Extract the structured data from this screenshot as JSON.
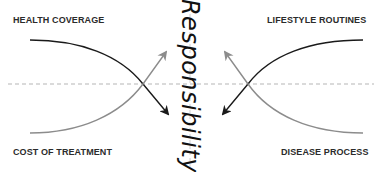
{
  "diagram": {
    "center_label": "Responsibility",
    "corners": {
      "top_left": "HEALTH COVERAGE",
      "top_right": "LIFESTYLE ROUTINES",
      "bottom_left": "COST OF TREATMENT",
      "bottom_right": "DISEASE PROCESS"
    },
    "colors": {
      "dark_arrow": "#1a1a1a",
      "light_arrow": "#8c8c8c",
      "dashed_line": "#b5b5b5",
      "text": "#2b2b2b"
    },
    "arrows": [
      {
        "from": "HEALTH COVERAGE",
        "direction": "down toward center",
        "shade": "dark"
      },
      {
        "from": "COST OF TREATMENT",
        "direction": "up toward center",
        "shade": "light"
      },
      {
        "from": "LIFESTYLE ROUTINES",
        "direction": "down toward center",
        "shade": "dark"
      },
      {
        "from": "DISEASE PROCESS",
        "direction": "up toward center",
        "shade": "light"
      }
    ]
  }
}
